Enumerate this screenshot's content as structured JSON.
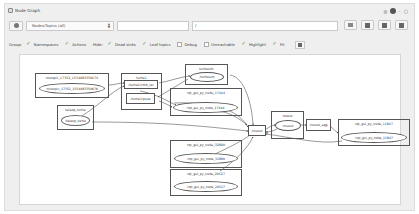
{
  "window": {
    "title": "Node Graph"
  },
  "toolbar": {
    "mode_select": "Nodes/Topics (all)",
    "namespace_filter": "",
    "topic_filter": "/",
    "buttons": [
      "load-dot",
      "save-dot",
      "save-svg",
      "save-image"
    ]
  },
  "options": {
    "group_label": "Group:",
    "hide_label": "Hide:",
    "items": [
      {
        "label": "Namespaces",
        "checked": true
      },
      {
        "label": "Actions",
        "checked": true
      },
      {
        "label": "Dead sinks",
        "checked": true
      },
      {
        "label": "Leaf topics",
        "checked": true
      },
      {
        "label": "Debug",
        "checked": false
      },
      {
        "label": "Unreachable",
        "checked": false
      },
      {
        "label": "Highlight",
        "checked": true
      },
      {
        "label": "Fit",
        "checked": true
      }
    ]
  },
  "graph": {
    "clusters": [
      {
        "id": "rostopic",
        "label": "rostopic_17352_1554083350676"
      },
      {
        "id": "teleop",
        "label": "teleop_turtle"
      },
      {
        "id": "turtle1",
        "label": "turtle1"
      },
      {
        "id": "turtlesim",
        "label": "turtlesim"
      },
      {
        "id": "rqt17444",
        "label": "rqt_gui_py_node_17444"
      },
      {
        "id": "rqt32880",
        "label": "rqt_gui_py_node_32880"
      },
      {
        "id": "rqt20527",
        "label": "rqt_gui_py_node_20527"
      },
      {
        "id": "rosout_ns",
        "label": "rosout"
      },
      {
        "id": "rqt11847",
        "label": "rqt_gui_py_node_11847"
      }
    ],
    "nodes": [
      {
        "id": "n_rostopic",
        "label": "/rostopic_17352_1554083350676",
        "shape": "ellipse"
      },
      {
        "id": "n_teleop",
        "label": "/teleop_turtle",
        "shape": "ellipse"
      },
      {
        "id": "t_cmd_vel",
        "label": "/turtle1/cmd_vel",
        "shape": "rect"
      },
      {
        "id": "t_pose",
        "label": "/turtle1/pose",
        "shape": "rect"
      },
      {
        "id": "n_turtlesim",
        "label": "/turtlesim",
        "shape": "ellipse"
      },
      {
        "id": "n_rqt17444",
        "label": "/rqt_gui_py_node_17444",
        "shape": "ellipse"
      },
      {
        "id": "n_rqt32880",
        "label": "/rqt_gui_py_node_32880",
        "shape": "ellipse"
      },
      {
        "id": "n_rqt20527",
        "label": "/rqt_gui_py_node_20527",
        "shape": "ellipse"
      },
      {
        "id": "t_rosout",
        "label": "/rosout",
        "shape": "rect"
      },
      {
        "id": "n_rosout",
        "label": "/rosout",
        "shape": "ellipse"
      },
      {
        "id": "t_rosout_agg",
        "label": "/rosout_agg",
        "shape": "rect"
      },
      {
        "id": "n_rqt11847",
        "label": "/rqt_gui_py_node_11847",
        "shape": "ellipse"
      }
    ]
  }
}
